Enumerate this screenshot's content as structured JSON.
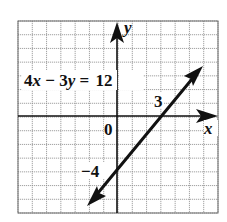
{
  "chart_data": {
    "type": "line",
    "title": "",
    "equation_label": {
      "lhs_coef_x": "4",
      "var_x": "x",
      "op": " − ",
      "lhs_coef_y": "3",
      "var_y": "y",
      "eq": " = ",
      "rhs": "12",
      "full": "4x − 3y = 12"
    },
    "xlabel": "x",
    "ylabel": "y",
    "origin_label": "0",
    "grid": true,
    "xlim": [
      -7,
      7
    ],
    "ylim": [
      -7,
      7
    ],
    "series": [
      {
        "name": "4x − 3y = 12",
        "equation": "4x - 3y = 12",
        "slope": 1.3333,
        "intercept": -4,
        "x": [
          -2,
          6
        ],
        "y": [
          -6.67,
          4
        ],
        "arrows": "both"
      }
    ],
    "intercepts": {
      "x_intercept": {
        "value": 3,
        "label": "3",
        "point": [
          3,
          0
        ]
      },
      "y_intercept": {
        "value": -4,
        "label": "−4",
        "point": [
          0,
          -4
        ]
      }
    },
    "colors": {
      "line": "#111111",
      "grid": "#8a8a8a",
      "background": "#ffffff"
    }
  }
}
